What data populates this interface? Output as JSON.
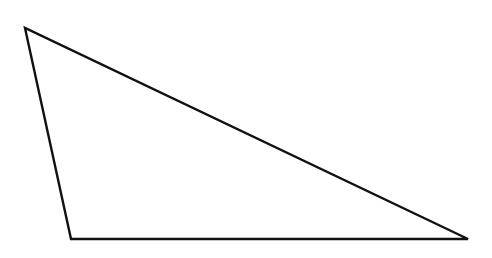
{
  "diagram": {
    "type": "triangle",
    "background": "#ffffff",
    "stroke": "#111111",
    "stroke_width": 2.4,
    "fill": "none",
    "vertices": [
      {
        "name": "top-left",
        "x": 25,
        "y": 28
      },
      {
        "name": "bottom-left",
        "x": 71,
        "y": 239
      },
      {
        "name": "bottom-right",
        "x": 468,
        "y": 239
      }
    ],
    "labels": []
  }
}
